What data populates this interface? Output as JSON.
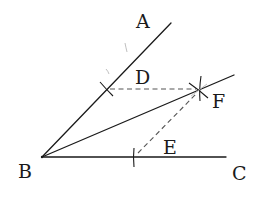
{
  "diagram": {
    "type": "geometric-construction",
    "points": {
      "A": {
        "label": "A",
        "x": 171,
        "y": 23,
        "label_x": 136,
        "label_y": 28
      },
      "B": {
        "label": "B",
        "x": 42,
        "y": 157,
        "label_x": 18,
        "label_y": 178
      },
      "C": {
        "label": "C",
        "x": 226,
        "y": 157,
        "label_x": 232,
        "label_y": 180
      },
      "D": {
        "label": "D",
        "x": 106,
        "y": 89,
        "label_x": 135,
        "label_y": 84
      },
      "E": {
        "label": "E",
        "x": 134,
        "y": 157,
        "label_x": 163,
        "label_y": 154
      },
      "F": {
        "label": "F",
        "x": 199,
        "y": 90,
        "label_x": 212,
        "label_y": 108
      }
    },
    "segments": [
      {
        "name": "ray-BA",
        "from": "B",
        "to": "A",
        "style": "solid"
      },
      {
        "name": "ray-BF",
        "from": "B",
        "to": "F-extended",
        "style": "solid"
      },
      {
        "name": "ray-BC",
        "from": "B",
        "to": "C",
        "style": "solid"
      },
      {
        "name": "segment-DF",
        "from": "D",
        "to": "F",
        "style": "dashed"
      },
      {
        "name": "segment-EF",
        "from": "E",
        "to": "F",
        "style": "dashed"
      }
    ],
    "labels": [
      "A",
      "B",
      "C",
      "D",
      "E",
      "F"
    ],
    "colors": {
      "ink": "#1a1a1a",
      "dash": "#555555",
      "faint": "#b8b8b8",
      "background": "#ffffff"
    }
  }
}
